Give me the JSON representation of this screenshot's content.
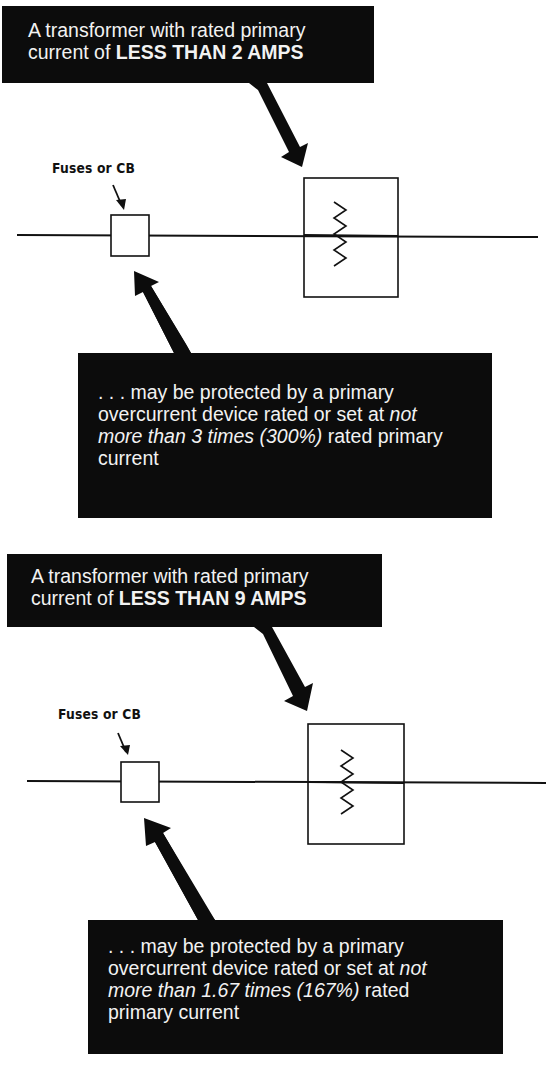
{
  "diagram_1": {
    "header": {
      "line1": "A transformer with rated primary",
      "line2_prefix": "current of ",
      "line2_bold": "LESS THAN 2 AMPS"
    },
    "device_label": "Fuses or CB",
    "note": {
      "line1": ". . . may be protected by a primary",
      "line2_prefix": "overcurrent device rated or set at ",
      "line2_italic": "not",
      "line3_italic": "more than 3 times (300%)",
      "line3_suffix": " rated primary",
      "line4": "current"
    }
  },
  "diagram_2": {
    "header": {
      "line1": "A transformer with rated primary",
      "line2_prefix": "current of ",
      "line2_bold": "LESS THAN 9 AMPS"
    },
    "device_label": "Fuses or CB",
    "note": {
      "line1": ". . . may be protected by a primary",
      "line2_prefix": "overcurrent device rated or set at ",
      "line2_italic": "not",
      "line3_italic": "more than 1.67 times (167%)",
      "line3_suffix": " rated",
      "line4": "primary current"
    }
  },
  "colors": {
    "callout_bg": "#0c0c0c",
    "callout_text": "#f2f2f2",
    "line": "#111111",
    "background": "#ffffff"
  }
}
